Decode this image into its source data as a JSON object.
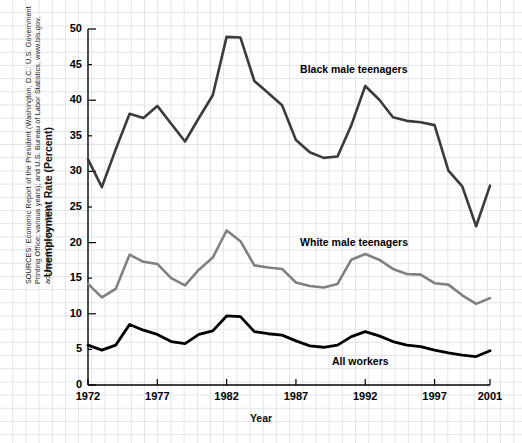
{
  "figure": {
    "source_note": "SOURCES: Economic Report of the President (Washington, D.C.: U.S. Government Printing Office; various years); and U.S. Bureau of Labor Statistics, www.bls.gov, accessed October 2001."
  },
  "chart_data": {
    "type": "line",
    "title": "",
    "xlabel": "Year",
    "ylabel": "Unemployment Rate (Percent)",
    "xlim": [
      1972,
      2001
    ],
    "ylim": [
      0,
      50
    ],
    "yticks": [
      0,
      5,
      10,
      15,
      20,
      25,
      30,
      35,
      40,
      45,
      50
    ],
    "xticks": [
      1972,
      1977,
      1982,
      1987,
      1992,
      1997,
      2001
    ],
    "xtick_labels": [
      "1972",
      "1977",
      "1982",
      "1987",
      "1992",
      "1997",
      "2001"
    ],
    "ytick_labels": [
      "0",
      "5",
      "10",
      "15",
      "20",
      "25",
      "30",
      "35",
      "40",
      "45",
      "50"
    ],
    "grid": true,
    "grid_color": "#dfe4ec",
    "legend_position": "inline-annotations",
    "x": [
      1972,
      1973,
      1974,
      1975,
      1976,
      1977,
      1978,
      1979,
      1980,
      1981,
      1982,
      1983,
      1984,
      1985,
      1986,
      1987,
      1988,
      1989,
      1990,
      1991,
      1992,
      1993,
      1994,
      1995,
      1996,
      1997,
      1998,
      1999,
      2000,
      2001
    ],
    "series": [
      {
        "name": "Black male teenagers",
        "color": "#3b3b3b",
        "width": 2.6,
        "label_x": 1987.3,
        "label_y": 44.2,
        "values": [
          31.7,
          27.8,
          33.1,
          38.1,
          37.5,
          39.2,
          36.7,
          34.2,
          37.5,
          40.7,
          48.9,
          48.8,
          42.7,
          41.0,
          39.3,
          34.4,
          32.7,
          31.9,
          32.1,
          36.5,
          42.0,
          40.1,
          37.6,
          37.1,
          36.9,
          36.5,
          30.1,
          27.9,
          22.3,
          28.0
        ]
      },
      {
        "name": "White male teenagers",
        "color": "#808080",
        "width": 2.6,
        "label_x": 1987.3,
        "label_y": 19.9,
        "values": [
          14.2,
          12.3,
          13.5,
          18.3,
          17.3,
          17.0,
          15.0,
          14.0,
          16.2,
          17.9,
          21.7,
          20.2,
          16.8,
          16.5,
          16.3,
          14.4,
          13.9,
          13.7,
          14.2,
          17.6,
          18.4,
          17.6,
          16.3,
          15.6,
          15.5,
          14.3,
          14.1,
          12.6,
          11.4,
          12.2
        ]
      },
      {
        "name": "All workers",
        "color": "#000000",
        "width": 2.8,
        "label_x": 1989.6,
        "label_y": 3.3,
        "values": [
          5.6,
          4.9,
          5.6,
          8.5,
          7.7,
          7.1,
          6.1,
          5.8,
          7.1,
          7.6,
          9.7,
          9.6,
          7.5,
          7.2,
          7.0,
          6.2,
          5.5,
          5.3,
          5.6,
          6.8,
          7.5,
          6.9,
          6.1,
          5.6,
          5.4,
          4.9,
          4.5,
          4.2,
          4.0,
          4.8
        ]
      }
    ]
  }
}
